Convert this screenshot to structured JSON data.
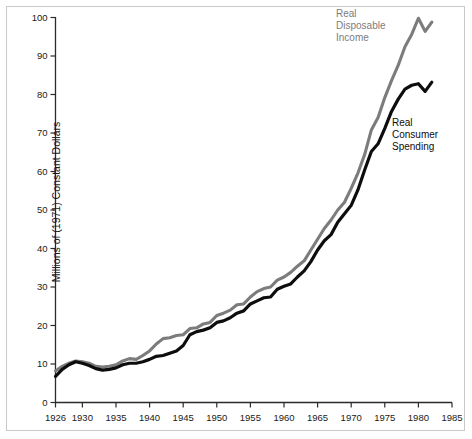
{
  "chart_data": {
    "type": "line",
    "title": "",
    "xlabel": "",
    "ylabel": "Millions of (1971) Constant Dollars",
    "xlim": [
      1926,
      1985
    ],
    "ylim": [
      0,
      100
    ],
    "grid": false,
    "legend_position": "inline-annotations",
    "x_ticks": [
      1926,
      1930,
      1935,
      1940,
      1945,
      1950,
      1955,
      1960,
      1965,
      1970,
      1975,
      1980,
      1985
    ],
    "y_ticks": [
      0,
      10,
      20,
      30,
      40,
      50,
      60,
      70,
      80,
      90,
      100
    ],
    "x": [
      1926,
      1927,
      1928,
      1929,
      1930,
      1931,
      1932,
      1933,
      1934,
      1935,
      1936,
      1937,
      1938,
      1939,
      1940,
      1941,
      1942,
      1943,
      1944,
      1945,
      1946,
      1947,
      1948,
      1949,
      1950,
      1951,
      1952,
      1953,
      1954,
      1955,
      1956,
      1957,
      1958,
      1959,
      1960,
      1961,
      1962,
      1963,
      1964,
      1965,
      1966,
      1967,
      1968,
      1969,
      1970,
      1971,
      1972,
      1973,
      1974,
      1975,
      1976,
      1977,
      1978,
      1979,
      1980,
      1981,
      1982
    ],
    "series": [
      {
        "name": "Real Disposable Income",
        "color": "#7c7c7c",
        "annotation": "Real\nDisposable\nIncome",
        "values": [
          8.2,
          9.4,
          10.2,
          10.8,
          10.6,
          10.2,
          9.4,
          9.2,
          9.4,
          9.8,
          10.8,
          11.4,
          11.2,
          12.2,
          13.4,
          15.2,
          16.6,
          16.8,
          17.4,
          17.6,
          19.2,
          19.4,
          20.4,
          20.8,
          22.6,
          23.2,
          24.0,
          25.4,
          25.6,
          27.4,
          28.8,
          29.6,
          30.0,
          31.8,
          32.6,
          33.8,
          35.4,
          36.8,
          39.6,
          42.4,
          45.2,
          47.4,
          50.0,
          52.0,
          55.6,
          59.6,
          64.4,
          70.8,
          74.0,
          79.2,
          83.6,
          87.6,
          92.4,
          95.6,
          99.8,
          96.4,
          98.8
        ]
      },
      {
        "name": "Real Consumer Spending",
        "color": "#0d0d0d",
        "annotation": "Real\nConsumer\nSpending",
        "values": [
          6.8,
          8.6,
          9.8,
          10.6,
          10.2,
          9.6,
          8.8,
          8.4,
          8.6,
          9.0,
          9.8,
          10.2,
          10.2,
          10.6,
          11.2,
          12.0,
          12.2,
          12.8,
          13.4,
          14.8,
          17.6,
          18.4,
          18.8,
          19.4,
          20.8,
          21.2,
          22.0,
          23.2,
          23.8,
          25.6,
          26.4,
          27.2,
          27.4,
          29.4,
          30.2,
          30.8,
          32.6,
          34.2,
          36.6,
          39.6,
          42.0,
          43.6,
          46.8,
          49.0,
          51.2,
          55.2,
          60.4,
          65.2,
          67.2,
          71.2,
          75.6,
          78.8,
          81.4,
          82.4,
          82.8,
          80.8,
          83.2
        ]
      }
    ]
  },
  "axis": {
    "y_tick_labels": [
      "0",
      "10",
      "20",
      "30",
      "40",
      "50",
      "60",
      "70",
      "80",
      "90",
      "100"
    ],
    "x_tick_labels": [
      "1926",
      "1930",
      "1935",
      "1940",
      "1945",
      "1950",
      "1955",
      "1960",
      "1965",
      "1970",
      "1975",
      "1980",
      "1985"
    ],
    "y_axis_title": "Millions of (1971) Constant Dollars"
  },
  "annotations": {
    "income": "Real\nDisposable\nIncome",
    "spending": "Real\nConsumer\nSpending"
  }
}
